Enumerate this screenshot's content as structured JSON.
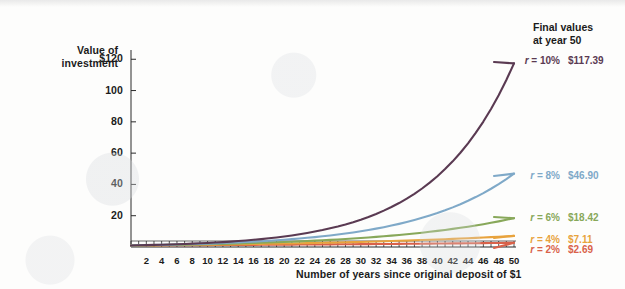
{
  "axes": {
    "y_caption_line1": "Value of",
    "y_caption_line2": "investment",
    "y_ticks": [
      "$120",
      "100",
      "80",
      "60",
      "40",
      "20"
    ],
    "y_tick_values": [
      120,
      100,
      80,
      60,
      40,
      20
    ],
    "x_caption": "Number of years since original deposit of $1",
    "x_ticks": [
      "2",
      "4",
      "6",
      "8",
      "10",
      "12",
      "14",
      "16",
      "18",
      "20",
      "22",
      "24",
      "26",
      "28",
      "30",
      "32",
      "34",
      "36",
      "38",
      "40",
      "42",
      "44",
      "46",
      "48",
      "50"
    ]
  },
  "legend": {
    "title_line1": "Final values",
    "title_line2": "at year 50",
    "rows": [
      {
        "rate_label": "r = 10%",
        "value": "$117.39",
        "color": "#5a3a52"
      },
      {
        "rate_label": "r = 8%",
        "value": "$46.90",
        "color": "#7fa9c8"
      },
      {
        "rate_label": "r = 6%",
        "value": "$18.42",
        "color": "#88a85a"
      },
      {
        "rate_label": "r = 4%",
        "value": "$7.11",
        "color": "#e8a33d"
      },
      {
        "rate_label": "r = 2%",
        "value": "$2.69",
        "color": "#d9624a"
      }
    ]
  },
  "chart_data": {
    "type": "line",
    "title": "",
    "xlabel": "Number of years since original deposit of $1",
    "ylabel": "Value of investment",
    "xlim": [
      0,
      50
    ],
    "ylim": [
      0,
      124
    ],
    "grid": false,
    "legend_position": "right",
    "x": [
      0,
      1,
      2,
      3,
      4,
      5,
      6,
      7,
      8,
      9,
      10,
      11,
      12,
      13,
      14,
      15,
      16,
      17,
      18,
      19,
      20,
      21,
      22,
      23,
      24,
      25,
      26,
      27,
      28,
      29,
      30,
      31,
      32,
      33,
      34,
      35,
      36,
      37,
      38,
      39,
      40,
      41,
      42,
      43,
      44,
      45,
      46,
      47,
      48,
      49,
      50
    ],
    "series": [
      {
        "name": "r = 10%",
        "rate": 0.1,
        "color": "#5a3a52",
        "final_value": 117.39,
        "values": [
          1,
          1.1,
          1.21,
          1.33,
          1.46,
          1.61,
          1.77,
          1.95,
          2.14,
          2.36,
          2.59,
          2.85,
          3.14,
          3.45,
          3.8,
          4.18,
          4.59,
          5.05,
          5.56,
          6.12,
          6.73,
          7.4,
          8.14,
          8.95,
          9.85,
          10.83,
          11.92,
          13.11,
          14.42,
          15.86,
          17.45,
          19.19,
          21.11,
          23.23,
          25.55,
          28.1,
          30.91,
          34.0,
          37.4,
          41.14,
          45.26,
          49.79,
          54.76,
          60.24,
          66.26,
          72.89,
          80.18,
          88.2,
          97.02,
          106.72,
          117.39
        ]
      },
      {
        "name": "r = 8%",
        "rate": 0.08,
        "color": "#7fa9c8",
        "final_value": 46.9,
        "values": [
          1,
          1.08,
          1.17,
          1.26,
          1.36,
          1.47,
          1.59,
          1.71,
          1.85,
          2,
          2.16,
          2.33,
          2.52,
          2.72,
          2.94,
          3.17,
          3.43,
          3.7,
          4,
          4.32,
          4.66,
          5.03,
          5.44,
          5.87,
          6.34,
          6.85,
          7.4,
          7.99,
          8.63,
          9.32,
          10.06,
          10.87,
          11.74,
          12.68,
          13.69,
          14.79,
          15.97,
          17.25,
          18.63,
          20.12,
          21.72,
          23.46,
          25.34,
          27.37,
          29.56,
          31.92,
          34.47,
          37.23,
          40.21,
          43.43,
          46.9
        ]
      },
      {
        "name": "r = 6%",
        "rate": 0.06,
        "color": "#88a85a",
        "final_value": 18.42,
        "values": [
          1,
          1.06,
          1.12,
          1.19,
          1.26,
          1.34,
          1.42,
          1.5,
          1.59,
          1.69,
          1.79,
          1.9,
          2.01,
          2.13,
          2.26,
          2.4,
          2.54,
          2.69,
          2.85,
          3.03,
          3.21,
          3.4,
          3.6,
          3.82,
          4.05,
          4.29,
          4.55,
          4.82,
          5.11,
          5.42,
          5.74,
          6.09,
          6.45,
          6.84,
          7.25,
          7.69,
          8.15,
          8.64,
          9.15,
          9.7,
          10.29,
          10.9,
          11.56,
          12.25,
          12.99,
          13.76,
          14.59,
          15.47,
          16.39,
          17.38,
          18.42
        ]
      },
      {
        "name": "r = 4%",
        "rate": 0.04,
        "color": "#e8a33d",
        "final_value": 7.11,
        "values": [
          1,
          1.04,
          1.08,
          1.12,
          1.17,
          1.22,
          1.27,
          1.32,
          1.37,
          1.42,
          1.48,
          1.54,
          1.6,
          1.67,
          1.73,
          1.8,
          1.87,
          1.95,
          2.03,
          2.11,
          2.19,
          2.28,
          2.37,
          2.46,
          2.56,
          2.67,
          2.77,
          2.88,
          3,
          3.12,
          3.24,
          3.37,
          3.51,
          3.65,
          3.79,
          3.95,
          4.1,
          4.27,
          4.44,
          4.62,
          4.8,
          4.99,
          5.19,
          5.4,
          5.62,
          5.84,
          6.07,
          6.32,
          6.57,
          6.83,
          7.11
        ]
      },
      {
        "name": "r = 2%",
        "rate": 0.02,
        "color": "#d9624a",
        "final_value": 2.69,
        "values": [
          1,
          1.02,
          1.04,
          1.06,
          1.08,
          1.1,
          1.13,
          1.15,
          1.17,
          1.2,
          1.22,
          1.24,
          1.27,
          1.29,
          1.32,
          1.35,
          1.37,
          1.4,
          1.43,
          1.46,
          1.49,
          1.52,
          1.55,
          1.58,
          1.61,
          1.64,
          1.67,
          1.71,
          1.74,
          1.78,
          1.81,
          1.85,
          1.88,
          1.92,
          1.96,
          2,
          2.04,
          2.08,
          2.12,
          2.16,
          2.21,
          2.25,
          2.3,
          2.34,
          2.39,
          2.44,
          2.49,
          2.54,
          2.59,
          2.64,
          2.69
        ]
      }
    ]
  }
}
